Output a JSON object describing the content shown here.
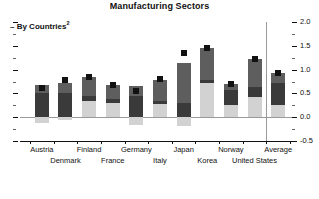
{
  "chart_data": {
    "type": "bar",
    "title": "Manufacturing Sectors",
    "subtitle": "By Countries",
    "subtitle_superscript": "2",
    "xlabel": "",
    "ylabel": "",
    "ylim": [
      -0.5,
      2.0
    ],
    "y_major_ticks": [
      -0.5,
      0.0,
      0.5,
      1.0,
      1.5,
      2.0
    ],
    "y_tick_labels": [
      "-0.5",
      "0.0",
      "0.5",
      "1.0",
      "1.5",
      "2.0"
    ],
    "y_minor_ticks": [
      -0.25,
      0.25,
      0.75,
      1.25,
      1.75
    ],
    "grid": false,
    "legend_position": "none",
    "stacked": true,
    "categories": [
      "Austria",
      "Denmark",
      "Finland",
      "France",
      "Germany",
      "Italy",
      "Japan",
      "Korea",
      "Norway",
      "United States",
      "Average"
    ],
    "series": [
      {
        "name": "segment-1",
        "color": "#d2d2d2",
        "values": [
          -0.12,
          -0.05,
          0.33,
          0.3,
          -0.16,
          0.28,
          -0.18,
          0.72,
          0.25,
          0.42,
          0.25
        ]
      },
      {
        "name": "segment-2",
        "color": "#3a3a3a",
        "values": [
          0.5,
          0.5,
          0.12,
          0.09,
          0.44,
          0.06,
          0.3,
          0.06,
          0.33,
          0.22,
          0.47
        ]
      },
      {
        "name": "segment-3",
        "color": "#5e5e5e",
        "values": [
          0.18,
          0.22,
          0.4,
          0.29,
          0.22,
          0.45,
          0.83,
          0.68,
          0.12,
          0.58,
          0.2
        ]
      }
    ],
    "markers": {
      "name": "total-marker",
      "color": "#111111",
      "shape": "square",
      "values": [
        0.62,
        0.78,
        0.85,
        0.68,
        0.55,
        0.8,
        1.35,
        1.45,
        0.7,
        1.23,
        0.92
      ]
    },
    "separator_before": "Average"
  }
}
